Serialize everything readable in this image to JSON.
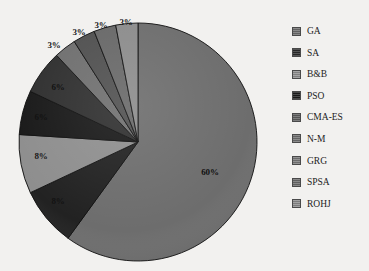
{
  "chart_data": {
    "type": "pie",
    "title": "",
    "subtitle": "",
    "xlabel": "",
    "ylabel": "",
    "grid": false,
    "legend_position": "right",
    "start_angle_deg": 0,
    "direction": "clockwise",
    "units": "percent",
    "categories": [
      "GA",
      "SA",
      "B&B",
      "PSO",
      "CMA-ES",
      "N-M",
      "GRG",
      "SPSA",
      "ROHJ"
    ],
    "values": [
      60,
      8,
      8,
      6,
      6,
      3,
      3,
      3,
      3
    ],
    "labels": [
      "60%",
      "8%",
      "8%",
      "6%",
      "6%",
      "3%",
      "3%",
      "3%",
      "3%"
    ],
    "colors": [
      "#6d6d6d",
      "#5e5e5e",
      "#8e8e8e",
      "#1c1c1c",
      "#2e2e2e",
      "#7a7a7a",
      "#555555",
      "#6a6a6a",
      "#8a8a8a"
    ],
    "slices": [
      {
        "label": "GA",
        "value": 60,
        "display": "60%",
        "color": "#6d6d6d",
        "label_x": 210,
        "label_y": 172,
        "label_tone": "on-mid"
      },
      {
        "label": "SA",
        "value": 8,
        "display": "8%",
        "color": "#222222",
        "label_x": 58,
        "label_y": 201,
        "label_tone": "on-dark"
      },
      {
        "label": "B&B",
        "value": 8,
        "display": "8%",
        "color": "#8e8e8e",
        "label_x": 41,
        "label_y": 156,
        "label_tone": ""
      },
      {
        "label": "PSO",
        "value": 6,
        "display": "6%",
        "color": "#191919",
        "label_x": 41,
        "label_y": 117,
        "label_tone": "on-dark"
      },
      {
        "label": "CMA-ES",
        "value": 6,
        "display": "6%",
        "color": "#2f2f2f",
        "label_x": 58,
        "label_y": 87,
        "label_tone": "on-dark"
      },
      {
        "label": "N-M",
        "value": 3,
        "display": "3%",
        "color": "#6f6f6f",
        "label_x": 54,
        "label_y": 45,
        "label_tone": ""
      },
      {
        "label": "GRG",
        "value": 3,
        "display": "3%",
        "color": "#505050",
        "label_x": 79,
        "label_y": 32,
        "label_tone": ""
      },
      {
        "label": "SPSA",
        "value": 3,
        "display": "3%",
        "color": "#686868",
        "label_x": 101,
        "label_y": 25,
        "label_tone": ""
      },
      {
        "label": "ROHJ",
        "value": 3,
        "display": "3%",
        "color": "#8c8c8c",
        "label_x": 126,
        "label_y": 22,
        "label_tone": ""
      }
    ]
  },
  "legend": {
    "items": [
      {
        "label": "GA",
        "color": "#6d6d6d"
      },
      {
        "label": "SA",
        "color": "#2a2a2a"
      },
      {
        "label": "B&B",
        "color": "#8e8e8e"
      },
      {
        "label": "PSO",
        "color": "#1b1b1b"
      },
      {
        "label": "CMA-ES",
        "color": "#5d5d5d"
      },
      {
        "label": "N-M",
        "color": "#6f6f6f"
      },
      {
        "label": "GRG",
        "color": "#787878"
      },
      {
        "label": "SPSA",
        "color": "#6a6a6a"
      },
      {
        "label": "ROHJ",
        "color": "#8a8a8a"
      }
    ]
  }
}
